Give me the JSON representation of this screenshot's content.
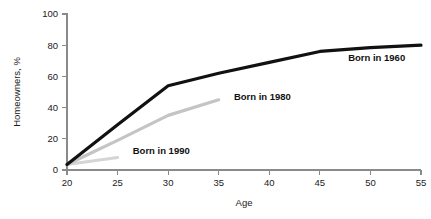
{
  "chart_data": {
    "type": "line",
    "title": "",
    "xlabel": "Age",
    "ylabel": "Homeowners, %",
    "xlim": [
      20,
      55
    ],
    "ylim": [
      0,
      100
    ],
    "xticks": [
      20,
      25,
      30,
      35,
      40,
      45,
      50,
      55
    ],
    "yticks": [
      0,
      20,
      40,
      60,
      80,
      100
    ],
    "xtick_labels": [
      "20",
      "25",
      "30",
      "35",
      "40",
      "45",
      "50",
      "55"
    ],
    "ytick_labels": [
      "0",
      "20",
      "40",
      "60",
      "80",
      "100"
    ],
    "grid": false,
    "legend_position": "inline-at-line-end",
    "series": [
      {
        "name": "Born in 1960",
        "color": "#111111",
        "stroke_width": 3.2,
        "label": "Born in 1960",
        "label_x": 47.8,
        "label_y": 70,
        "x": [
          20,
          25,
          30,
          35,
          40,
          45,
          50,
          55
        ],
        "values": [
          3.5,
          29,
          54,
          62,
          69,
          76,
          78.5,
          80
        ]
      },
      {
        "name": "Born in 1980",
        "color": "#c4c4c4",
        "stroke_width": 3.2,
        "label": "Born in 1980",
        "label_x": 36.5,
        "label_y": 45,
        "x": [
          20,
          25,
          30,
          35
        ],
        "values": [
          3.5,
          19,
          35,
          45
        ]
      },
      {
        "name": "Born in 1990",
        "color": "#d5d5d5",
        "stroke_width": 3.2,
        "label": "Born in 1990",
        "label_x": 26.5,
        "label_y": 10,
        "x": [
          20,
          25
        ],
        "values": [
          3.5,
          8
        ]
      }
    ]
  },
  "colors": {
    "axis": "#8a8a8a",
    "text": "#1a1a1a",
    "background": "#ffffff",
    "series_1960": "#111111",
    "series_1980": "#c4c4c4",
    "series_1990": "#d5d5d5"
  }
}
